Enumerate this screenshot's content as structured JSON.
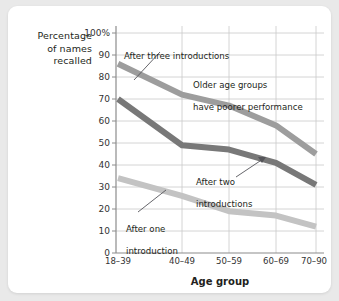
{
  "chart_data": {
    "type": "line",
    "title": "",
    "subtitle": "",
    "xlabel": "Age group",
    "ylabel": "Percentage of names recalled",
    "ylabel_lines": [
      "Percentage",
      "of names",
      "recalled"
    ],
    "categories": [
      "18–39",
      "40–49",
      "50–59",
      "60–69",
      "70–90"
    ],
    "ylim": [
      0,
      100
    ],
    "ytick_labels": [
      "100%",
      "90",
      "80",
      "70",
      "60",
      "50",
      "40",
      "30",
      "20",
      "10",
      "0"
    ],
    "ytick_values": [
      100,
      90,
      80,
      70,
      60,
      50,
      40,
      30,
      20,
      10,
      0
    ],
    "grid": true,
    "legend": "none",
    "series": [
      {
        "name": "After three introductions",
        "color": "#9d9d9d",
        "values": [
          86,
          72,
          67,
          58,
          45
        ]
      },
      {
        "name": "After two introductions",
        "color": "#787878",
        "values": [
          70,
          49,
          47,
          41,
          31
        ]
      },
      {
        "name": "After one introduction",
        "color": "#c3c3c3",
        "values": [
          34,
          26,
          19,
          17,
          12
        ]
      }
    ],
    "annotations": [
      {
        "id": "after-three-introductions",
        "text": "After three introductions",
        "lines": [
          "After three introductions"
        ]
      },
      {
        "id": "older-age-groups",
        "text": "Older age groups have poorer performance",
        "lines": [
          "Older age groups",
          "have poorer performance"
        ]
      },
      {
        "id": "after-two-introductions",
        "text": "After two introductions",
        "lines": [
          "After two",
          "introductions"
        ]
      },
      {
        "id": "after-one-introduction",
        "text": "After one introduction",
        "lines": [
          "After one",
          "introduction"
        ]
      }
    ]
  },
  "colors": {
    "background": "#e9e9e9",
    "card": "#ffffff",
    "grid": "#c9c9c9",
    "axis": "#8c8c8c",
    "text": "#231f20",
    "line_three": "#9d9d9d",
    "line_two": "#787878",
    "line_one": "#c3c3c3"
  }
}
